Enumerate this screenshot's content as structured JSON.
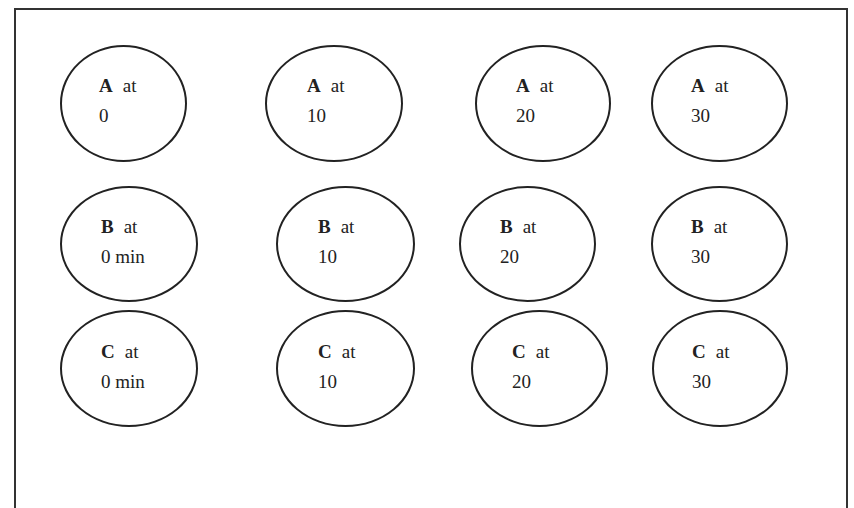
{
  "diagram": {
    "connector_word": "at",
    "rows": [
      {
        "letter": "A",
        "nodes": [
          {
            "time": "0",
            "x": 60,
            "y": 45,
            "w": 127,
            "h": 117,
            "tx": 37,
            "ty": 24
          },
          {
            "time": "10",
            "x": 265,
            "y": 45,
            "w": 138,
            "h": 117,
            "tx": 40,
            "ty": 24
          },
          {
            "time": "20",
            "x": 475,
            "y": 45,
            "w": 136,
            "h": 117,
            "tx": 39,
            "ty": 24
          },
          {
            "time": "30",
            "x": 651,
            "y": 45,
            "w": 137,
            "h": 117,
            "tx": 38,
            "ty": 24
          }
        ]
      },
      {
        "letter": "B",
        "nodes": [
          {
            "time": "0 min",
            "x": 60,
            "y": 186,
            "w": 138,
            "h": 116,
            "tx": 39,
            "ty": 24
          },
          {
            "time": "10",
            "x": 276,
            "y": 186,
            "w": 139,
            "h": 116,
            "tx": 40,
            "ty": 24
          },
          {
            "time": "20",
            "x": 459,
            "y": 186,
            "w": 137,
            "h": 116,
            "tx": 39,
            "ty": 24
          },
          {
            "time": "30",
            "x": 651,
            "y": 186,
            "w": 137,
            "h": 116,
            "tx": 38,
            "ty": 24
          }
        ]
      },
      {
        "letter": "C",
        "nodes": [
          {
            "time": "0 min",
            "x": 60,
            "y": 310,
            "w": 138,
            "h": 117,
            "tx": 39,
            "ty": 25
          },
          {
            "time": "10",
            "x": 276,
            "y": 310,
            "w": 139,
            "h": 117,
            "tx": 40,
            "ty": 25
          },
          {
            "time": "20",
            "x": 471,
            "y": 310,
            "w": 137,
            "h": 117,
            "tx": 39,
            "ty": 25
          },
          {
            "time": "30",
            "x": 652,
            "y": 310,
            "w": 136,
            "h": 117,
            "tx": 38,
            "ty": 25
          }
        ]
      }
    ]
  }
}
